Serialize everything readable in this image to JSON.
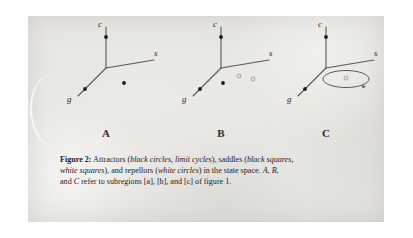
{
  "figure": {
    "caption_label": "Figure 2:",
    "caption_lines": [
      "Attractors (black circles, limit cycles), saddles (black squares,",
      "white squares), and repellors (white circles) in the state space. A, B,",
      "and C refer to subregions [a], [b], and [c] of figure 1."
    ],
    "caption_line1_plain_a": " Attractors (",
    "caption_line1_italic_a": "black circles, limit cycles",
    "caption_line1_plain_b": "), saddles (",
    "caption_line1_italic_b": "black squares,",
    "caption_line2_italic_a": "white squares",
    "caption_line2_plain_a": "), and repellors (",
    "caption_line2_italic_b": "white circles",
    "caption_line2_plain_b": ") in the state space. ",
    "caption_line2_italic_c": "A",
    "caption_line2_plain_c": ", ",
    "caption_line2_italic_d": "B",
    "caption_line2_plain_d": ",",
    "caption_line3_plain_a": "and ",
    "caption_line3_italic_a": "C",
    "caption_line3_plain_b": " refer to subregions [a], [b], and [c] of figure 1."
  },
  "axes": {
    "vertical_label": "c",
    "left_label": "g",
    "right_label": "s"
  },
  "panels": [
    {
      "id": "A",
      "sublabel": "A",
      "subregion": "[a]",
      "markers": [
        {
          "kind": "black-circle",
          "role": "attractor",
          "axis": "c"
        },
        {
          "kind": "black-circle",
          "role": "attractor",
          "axis": "g"
        },
        {
          "kind": "black-circle",
          "role": "attractor",
          "axis": "interior"
        }
      ]
    },
    {
      "id": "B",
      "sublabel": "B",
      "subregion": "[b]",
      "markers": [
        {
          "kind": "black-circle",
          "role": "attractor",
          "axis": "c"
        },
        {
          "kind": "black-circle",
          "role": "attractor",
          "axis": "g"
        },
        {
          "kind": "black-circle",
          "role": "attractor",
          "axis": "interior"
        },
        {
          "kind": "white-circle",
          "role": "repellor",
          "axis": "interior"
        },
        {
          "kind": "white-circle",
          "role": "repellor",
          "axis": "interior"
        }
      ]
    },
    {
      "id": "C",
      "sublabel": "C",
      "subregion": "[c]",
      "markers": [
        {
          "kind": "black-circle",
          "role": "attractor",
          "axis": "c"
        },
        {
          "kind": "black-circle",
          "role": "attractor",
          "axis": "g"
        },
        {
          "kind": "limit-cycle",
          "role": "attractor",
          "axis": "interior"
        },
        {
          "kind": "white-circle",
          "role": "repellor",
          "axis": "interior"
        }
      ]
    }
  ],
  "colors": {
    "ink": "#2e2c2a",
    "paper": "#e7e5e1",
    "axis": "#565450",
    "marker_fill": "#1d1b19",
    "repellor_stroke": "#8e8c88"
  }
}
